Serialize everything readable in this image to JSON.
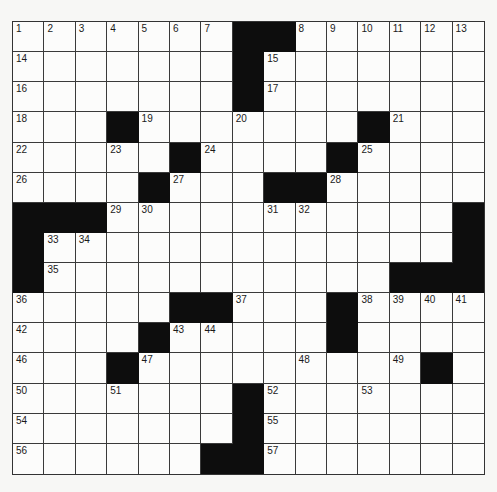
{
  "puzzle": {
    "rows": 15,
    "cols": 15,
    "colors": {
      "black": "#0d0d0d",
      "white": "#fcfcfb",
      "line": "#3a3a3a"
    },
    "layout": [
      "#######..######",
      "",
      ""
    ],
    "grid": [
      ".......##......",
      ".......#.......",
      ".......#.......",
      "...#.......#...",
      ".....#....#....",
      "....#...##.....",
      "###...........#",
      "#.............#",
      "#...........###",
      ".....##...#....",
      "....#.....#....",
      "...#.........#.",
      ".......#.......",
      ".......#.......",
      "......##......."
    ],
    "numbers": [
      {
        "r": 0,
        "c": 0,
        "n": "1"
      },
      {
        "r": 0,
        "c": 1,
        "n": "2"
      },
      {
        "r": 0,
        "c": 2,
        "n": "3"
      },
      {
        "r": 0,
        "c": 3,
        "n": "4"
      },
      {
        "r": 0,
        "c": 4,
        "n": "5"
      },
      {
        "r": 0,
        "c": 5,
        "n": "6"
      },
      {
        "r": 0,
        "c": 6,
        "n": "7"
      },
      {
        "r": 0,
        "c": 9,
        "n": "8"
      },
      {
        "r": 0,
        "c": 10,
        "n": "9"
      },
      {
        "r": 0,
        "c": 11,
        "n": "10"
      },
      {
        "r": 0,
        "c": 12,
        "n": "11"
      },
      {
        "r": 0,
        "c": 13,
        "n": "12"
      },
      {
        "r": 0,
        "c": 14,
        "n": "13"
      },
      {
        "r": 1,
        "c": 0,
        "n": "14"
      },
      {
        "r": 1,
        "c": 8,
        "n": "15"
      },
      {
        "r": 2,
        "c": 0,
        "n": "16"
      },
      {
        "r": 2,
        "c": 8,
        "n": "17"
      },
      {
        "r": 3,
        "c": 0,
        "n": "18"
      },
      {
        "r": 3,
        "c": 4,
        "n": "19"
      },
      {
        "r": 3,
        "c": 7,
        "n": "20"
      },
      {
        "r": 3,
        "c": 12,
        "n": "21"
      },
      {
        "r": 4,
        "c": 0,
        "n": "22"
      },
      {
        "r": 4,
        "c": 3,
        "n": "23"
      },
      {
        "r": 4,
        "c": 6,
        "n": "24"
      },
      {
        "r": 4,
        "c": 11,
        "n": "25"
      },
      {
        "r": 5,
        "c": 0,
        "n": "26"
      },
      {
        "r": 5,
        "c": 5,
        "n": "27"
      },
      {
        "r": 5,
        "c": 10,
        "n": "28"
      },
      {
        "r": 6,
        "c": 3,
        "n": "29"
      },
      {
        "r": 6,
        "c": 4,
        "n": "30"
      },
      {
        "r": 6,
        "c": 8,
        "n": "31"
      },
      {
        "r": 6,
        "c": 9,
        "n": "32"
      },
      {
        "r": 7,
        "c": 1,
        "n": "33"
      },
      {
        "r": 7,
        "c": 2,
        "n": "34"
      },
      {
        "r": 8,
        "c": 1,
        "n": "35"
      },
      {
        "r": 9,
        "c": 0,
        "n": "36"
      },
      {
        "r": 9,
        "c": 7,
        "n": "37"
      },
      {
        "r": 9,
        "c": 11,
        "n": "38"
      },
      {
        "r": 9,
        "c": 12,
        "n": "39"
      },
      {
        "r": 9,
        "c": 13,
        "n": "40"
      },
      {
        "r": 9,
        "c": 14,
        "n": "41"
      },
      {
        "r": 10,
        "c": 0,
        "n": "42"
      },
      {
        "r": 10,
        "c": 5,
        "n": "43"
      },
      {
        "r": 10,
        "c": 6,
        "n": "44"
      },
      {
        "r": 10,
        "c": 10,
        "n": "45"
      },
      {
        "r": 11,
        "c": 0,
        "n": "46"
      },
      {
        "r": 11,
        "c": 4,
        "n": "47"
      },
      {
        "r": 11,
        "c": 9,
        "n": "48"
      },
      {
        "r": 11,
        "c": 12,
        "n": "49"
      },
      {
        "r": 12,
        "c": 0,
        "n": "50"
      },
      {
        "r": 12,
        "c": 3,
        "n": "51"
      },
      {
        "r": 12,
        "c": 8,
        "n": "52"
      },
      {
        "r": 12,
        "c": 11,
        "n": "53"
      },
      {
        "r": 13,
        "c": 0,
        "n": "54"
      },
      {
        "r": 13,
        "c": 8,
        "n": "55"
      },
      {
        "r": 14,
        "c": 0,
        "n": "56"
      },
      {
        "r": 14,
        "c": 8,
        "n": "57"
      }
    ]
  }
}
